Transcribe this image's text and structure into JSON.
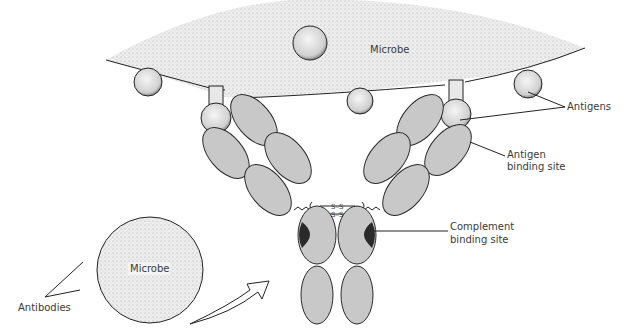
{
  "diagram": {
    "labels": {
      "microbe_top": "Microbe",
      "microbe_bottom": "Microbe",
      "antigens": "Antigens",
      "antigen_binding_site_line1": "Antigen",
      "antigen_binding_site_line2": "binding site",
      "complement_binding_site_line1": "Complement",
      "complement_binding_site_line2": "binding site",
      "antibodies": "Antibodies",
      "disulfide_1": "S–S",
      "disulfide_2": "S–S"
    },
    "colors": {
      "microbe_fill": "#e4e4e4",
      "domain_fill": "#c8c8c8",
      "complement_site": "#2a2a2a",
      "antigen_fill": "#efefef",
      "text": "#3a3a3a"
    }
  }
}
